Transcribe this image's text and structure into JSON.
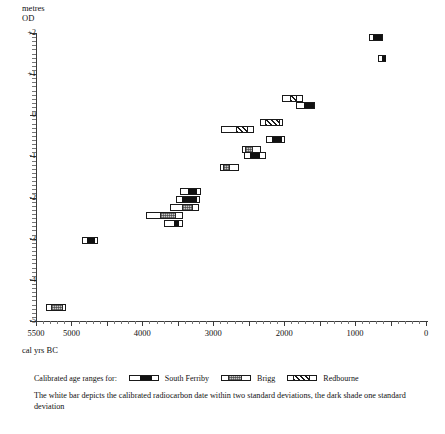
{
  "axes": {
    "y_title": "metres\nOD",
    "y_title_line1": "metres",
    "y_title_line2": "OD",
    "x_title": "cal yrs BC",
    "y_ticks": [
      "+2",
      "+1",
      "0",
      "-1",
      "-2",
      "-3",
      "-4",
      "-5"
    ],
    "y_values": [
      2,
      1,
      0,
      -1,
      -2,
      -3,
      -4,
      -5
    ],
    "x_ticks": [
      "5500",
      "5000",
      "4000",
      "3000",
      "2000",
      "1000",
      "0"
    ],
    "x_values": [
      5500,
      5000,
      4000,
      3000,
      2000,
      1000,
      0
    ]
  },
  "legend": {
    "lead": "Calibrated age ranges for:",
    "items": [
      {
        "label": "South Ferriby",
        "fill": "fill-south-ferriby",
        "inner_left_pct": 38,
        "inner_width_pct": 42
      },
      {
        "label": "Brigg",
        "fill": "fill-brigg",
        "inner_left_pct": 22,
        "inner_width_pct": 50
      },
      {
        "label": "Redbourne",
        "fill": "fill-redbourne",
        "inner_left_pct": 18,
        "inner_width_pct": 58
      }
    ]
  },
  "footnote": "The white bar depicts the calibrated radiocarbon date within two standard deviations, the dark shade one standard deviation",
  "chart_data": {
    "type": "bar",
    "title": "",
    "subtitle": "",
    "xlabel": "cal yrs BC",
    "ylabel": "metres OD",
    "xlim": [
      5500,
      0
    ],
    "ylim": [
      -5,
      2
    ],
    "x_reversed": true,
    "grid": false,
    "legend_position": "below-plot",
    "series": [
      {
        "name": "South Ferriby",
        "fill": "fill-south-ferriby"
      },
      {
        "name": "Brigg",
        "fill": "fill-brigg"
      },
      {
        "name": "Redbourne",
        "fill": "fill-redbourne"
      }
    ],
    "value_units": {
      "x": "cal yrs BC",
      "y": "metres OD"
    },
    "note": "Each bar spans the 2-sigma calibrated age range; the shaded inner block spans the 1-sigma range.",
    "bars": [
      {
        "id": 1,
        "site": "South Ferriby",
        "fill": "fill-south-ferriby",
        "y_od": 1.88,
        "x2sd_from": 810,
        "x2sd_to": 610,
        "x1sd_from": 760,
        "x1sd_to": 630
      },
      {
        "id": 2,
        "site": "South Ferriby",
        "fill": "fill-south-ferriby",
        "y_od": 1.37,
        "x2sd_from": 670,
        "x2sd_to": 560,
        "x1sd_from": 630,
        "x1sd_to": 580
      },
      {
        "id": 3,
        "site": "Redbourne",
        "fill": "fill-redbourne",
        "y_od": 0.42,
        "x2sd_from": 2030,
        "x2sd_to": 1740,
        "x1sd_from": 1930,
        "x1sd_to": 1830
      },
      {
        "id": 4,
        "site": "South Ferriby",
        "fill": "fill-south-ferriby",
        "y_od": 0.24,
        "x2sd_from": 1840,
        "x2sd_to": 1560,
        "x1sd_from": 1740,
        "x1sd_to": 1590
      },
      {
        "id": 5,
        "site": "Redbourne",
        "fill": "fill-redbourne",
        "y_od": -0.18,
        "x2sd_from": 2340,
        "x2sd_to": 2020,
        "x1sd_from": 2290,
        "x1sd_to": 2070
      },
      {
        "id": 6,
        "site": "Redbourne",
        "fill": "fill-redbourne",
        "y_od": -0.35,
        "x2sd_from": 2890,
        "x2sd_to": 2420,
        "x1sd_from": 2700,
        "x1sd_to": 2530
      },
      {
        "id": 7,
        "site": "South Ferriby",
        "fill": "fill-south-ferriby",
        "y_od": -0.6,
        "x2sd_from": 2250,
        "x2sd_to": 1990,
        "x1sd_from": 2190,
        "x1sd_to": 2040
      },
      {
        "id": 8,
        "site": "Brigg",
        "fill": "fill-brigg",
        "y_od": -0.82,
        "x2sd_from": 2590,
        "x2sd_to": 2330,
        "x1sd_from": 2570,
        "x1sd_to": 2460
      },
      {
        "id": 9,
        "site": "South Ferriby",
        "fill": "fill-south-ferriby",
        "y_od": -0.98,
        "x2sd_from": 2570,
        "x2sd_to": 2260,
        "x1sd_from": 2500,
        "x1sd_to": 2360
      },
      {
        "id": 10,
        "site": "Brigg",
        "fill": "fill-brigg",
        "y_od": -1.28,
        "x2sd_from": 2900,
        "x2sd_to": 2640,
        "x1sd_from": 2880,
        "x1sd_to": 2780
      },
      {
        "id": 11,
        "site": "South Ferriby",
        "fill": "fill-south-ferriby",
        "y_od": -1.86,
        "x2sd_from": 3470,
        "x2sd_to": 3170,
        "x1sd_from": 3370,
        "x1sd_to": 3250
      },
      {
        "id": 12,
        "site": "South Ferriby",
        "fill": "fill-south-ferriby",
        "y_od": -2.05,
        "x2sd_from": 3520,
        "x2sd_to": 3180,
        "x1sd_from": 3450,
        "x1sd_to": 3250
      },
      {
        "id": 13,
        "site": "Brigg",
        "fill": "fill-brigg",
        "y_od": -2.24,
        "x2sd_from": 3610,
        "x2sd_to": 3200,
        "x1sd_from": 3460,
        "x1sd_to": 3300
      },
      {
        "id": 14,
        "site": "Brigg",
        "fill": "fill-brigg",
        "y_od": -2.43,
        "x2sd_from": 3950,
        "x2sd_to": 3420,
        "x1sd_from": 3770,
        "x1sd_to": 3540
      },
      {
        "id": 15,
        "site": "South Ferriby",
        "fill": "fill-south-ferriby",
        "y_od": -2.62,
        "x2sd_from": 3690,
        "x2sd_to": 3430,
        "x1sd_from": 3570,
        "x1sd_to": 3500
      },
      {
        "id": 16,
        "site": "South Ferriby",
        "fill": "fill-south-ferriby",
        "y_od": -3.05,
        "x2sd_from": 4850,
        "x2sd_to": 4620,
        "x1sd_from": 4790,
        "x1sd_to": 4680
      },
      {
        "id": 17,
        "site": "Brigg",
        "fill": "fill-brigg",
        "y_od": -4.68,
        "x2sd_from": 5360,
        "x2sd_to": 5080,
        "x1sd_from": 5300,
        "x1sd_to": 5130
      }
    ]
  }
}
